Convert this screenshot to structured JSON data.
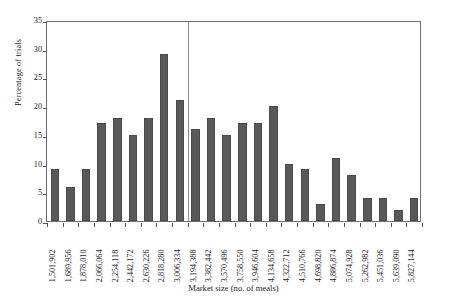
{
  "chart_data": {
    "type": "bar",
    "title": "",
    "xlabel": "Market size (no. of meals)",
    "ylabel": "Percentage of trials",
    "ylim": [
      0,
      35
    ],
    "yticks": [
      0,
      5,
      10,
      15,
      20,
      25,
      30,
      35
    ],
    "grid": false,
    "legend": null,
    "bar_color": "#595959",
    "frame_color": "#6f6f6f",
    "annotations": [
      {
        "type": "vertical-reference-line",
        "at_category": "3,194,388",
        "color": "#8b8b8b"
      }
    ],
    "categories": [
      "1,501,902",
      "1,689,956",
      "1,878,010",
      "2,066,064",
      "2,254,118",
      "2,442,172",
      "2,630,226",
      "2,818,280",
      "3,006,334",
      "3,194,388",
      "3,382,442",
      "3,570,496",
      "3,758,550",
      "3,946,604",
      "4,134,658",
      "4,322,712",
      "4,510,766",
      "4,698,820",
      "4,886,874",
      "5,074,928",
      "5,262,982",
      "5,451,036",
      "5,639,090",
      "5,827,144"
    ],
    "values": [
      9,
      6,
      9,
      17,
      18,
      15,
      18,
      29,
      21,
      16,
      18,
      15,
      17,
      17,
      20,
      10,
      9,
      3,
      11,
      8,
      4,
      4,
      2,
      4
    ]
  }
}
